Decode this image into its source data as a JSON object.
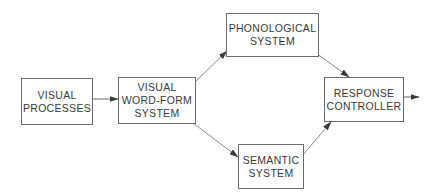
{
  "diagram": {
    "type": "flowchart",
    "colors": {
      "box_border": "#6b6b6b",
      "text": "#3a3a3a",
      "edge": "#6b6b6b",
      "background": "#ffffff"
    },
    "nodes": {
      "visual_processes": {
        "line1": "VISUAL",
        "line2": "PROCESSES",
        "line3": ""
      },
      "visual_word_form": {
        "line1": "VISUAL",
        "line2": "WORD-FORM",
        "line3": "SYSTEM"
      },
      "phonological": {
        "line1": "PHONOLOGICAL",
        "line2": "SYSTEM",
        "line3": ""
      },
      "semantic": {
        "line1": "SEMANTIC",
        "line2": "SYSTEM",
        "line3": ""
      },
      "response_controller": {
        "line1": "RESPONSE",
        "line2": "CONTROLLER",
        "line3": ""
      }
    },
    "edges": [
      {
        "from": "VISUAL PROCESSES",
        "to": "VISUAL WORD-FORM SYSTEM"
      },
      {
        "from": "VISUAL WORD-FORM SYSTEM",
        "to": "PHONOLOGICAL SYSTEM"
      },
      {
        "from": "VISUAL WORD-FORM SYSTEM",
        "to": "SEMANTIC SYSTEM"
      },
      {
        "from": "PHONOLOGICAL SYSTEM",
        "to": "RESPONSE CONTROLLER"
      },
      {
        "from": "SEMANTIC SYSTEM",
        "to": "RESPONSE CONTROLLER"
      },
      {
        "from": "RESPONSE CONTROLLER",
        "to": "output"
      }
    ]
  }
}
